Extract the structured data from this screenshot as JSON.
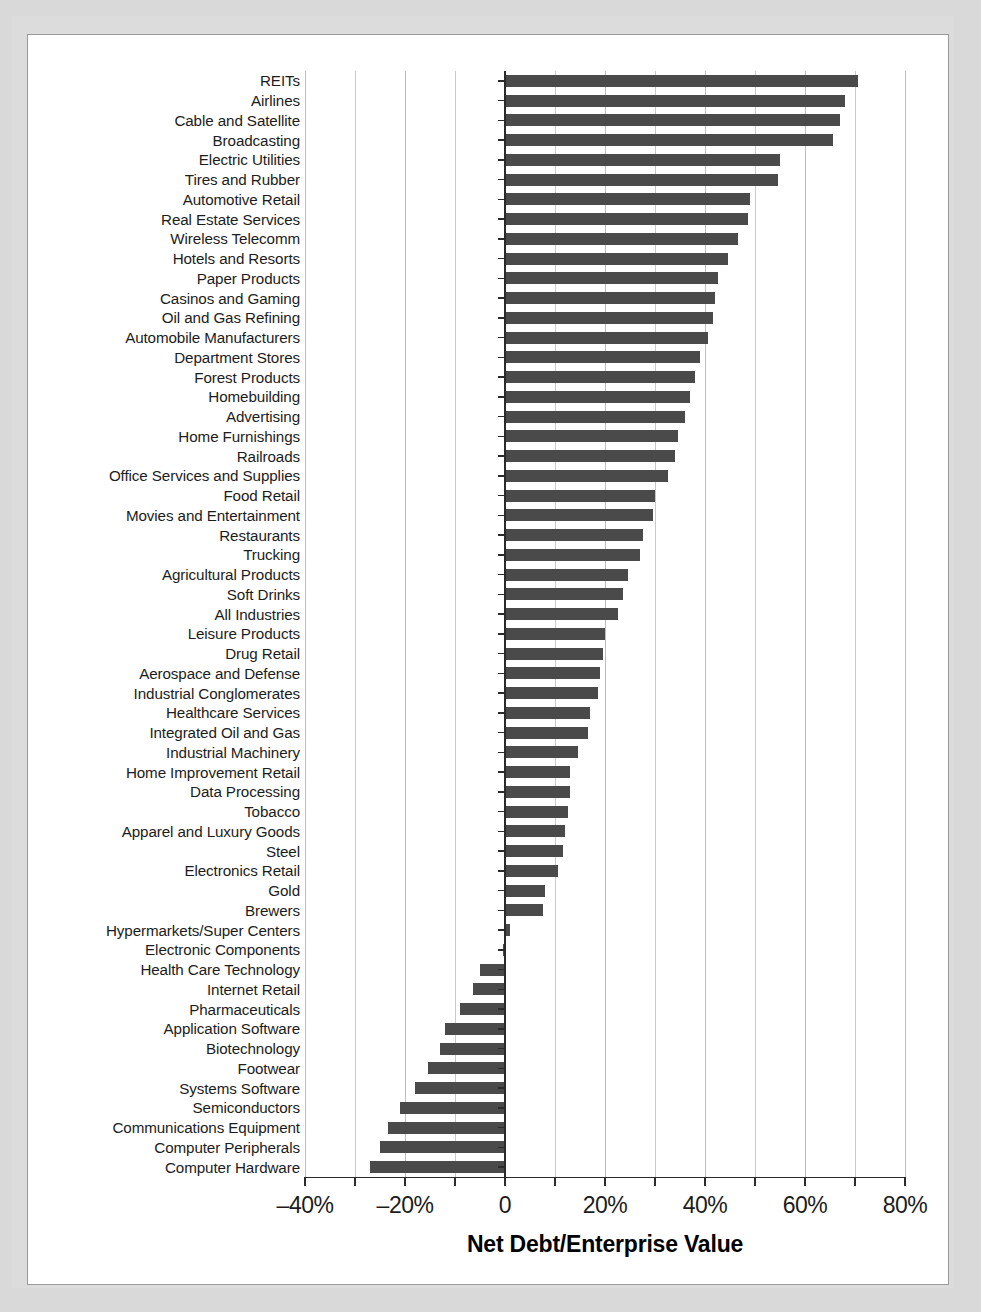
{
  "figure": {
    "background_color": "#d9d9d9",
    "panel_color": "#ffffff",
    "bar_color": "#4a4a4a",
    "axis_color": "#2b2b2b",
    "grid_color": "#c9c9c9"
  },
  "chart_data": {
    "type": "bar",
    "orientation": "horizontal",
    "title": "",
    "xlabel": "Net Debt/Enterprise Value",
    "ylabel": "",
    "xlim": [
      -40,
      80
    ],
    "xticks": [
      -40,
      -30,
      -20,
      -10,
      0,
      10,
      20,
      30,
      40,
      50,
      60,
      70,
      80
    ],
    "xtick_labels": [
      {
        "value": -40,
        "label": "–40%"
      },
      {
        "value": -20,
        "label": "–20%"
      },
      {
        "value": 0,
        "label": "0"
      },
      {
        "value": 20,
        "label": "20%"
      },
      {
        "value": 40,
        "label": "40%"
      },
      {
        "value": 60,
        "label": "60%"
      },
      {
        "value": 80,
        "label": "80%"
      }
    ],
    "grid": true,
    "grid_axis": "x",
    "legend": null,
    "units": "percent",
    "categories": [
      "REITs",
      "Airlines",
      "Cable and Satellite",
      "Broadcasting",
      "Electric Utilities",
      "Tires and Rubber",
      "Automotive Retail",
      "Real Estate Services",
      "Wireless Telecomm",
      "Hotels and Resorts",
      "Paper Products",
      "Casinos and Gaming",
      "Oil and Gas Refining",
      "Automobile Manufacturers",
      "Department Stores",
      "Forest Products",
      "Homebuilding",
      "Advertising",
      "Home Furnishings",
      "Railroads",
      "Office Services and Supplies",
      "Food Retail",
      "Movies and Entertainment",
      "Restaurants",
      "Trucking",
      "Agricultural Products",
      "Soft Drinks",
      "All Industries",
      "Leisure Products",
      "Drug Retail",
      "Aerospace and Defense",
      "Industrial Conglomerates",
      "Healthcare Services",
      "Integrated Oil and Gas",
      "Industrial Machinery",
      "Home Improvement Retail",
      "Data Processing",
      "Tobacco",
      "Apparel and Luxury Goods",
      "Steel",
      "Electronics Retail",
      "Gold",
      "Brewers",
      "Hypermarkets/Super Centers",
      "Electronic Components",
      "Health Care Technology",
      "Internet Retail",
      "Pharmaceuticals",
      "Application Software",
      "Biotechnology",
      "Footwear",
      "Systems Software",
      "Semiconductors",
      "Communications Equipment",
      "Computer Peripherals",
      "Computer Hardware"
    ],
    "values": [
      70.5,
      68.0,
      67.0,
      65.5,
      55.0,
      54.5,
      49.0,
      48.5,
      46.5,
      44.5,
      42.5,
      42.0,
      41.5,
      40.5,
      39.0,
      38.0,
      37.0,
      36.0,
      34.5,
      34.0,
      32.5,
      30.0,
      29.5,
      27.5,
      27.0,
      24.5,
      23.5,
      22.5,
      20.0,
      19.5,
      19.0,
      18.5,
      17.0,
      16.5,
      14.5,
      13.0,
      13.0,
      12.5,
      12.0,
      11.5,
      10.5,
      8.0,
      7.5,
      1.0,
      -0.5,
      -5.0,
      -6.5,
      -9.0,
      -12.0,
      -13.0,
      -15.5,
      -18.0,
      -21.0,
      -23.5,
      -25.0,
      -27.0
    ]
  }
}
